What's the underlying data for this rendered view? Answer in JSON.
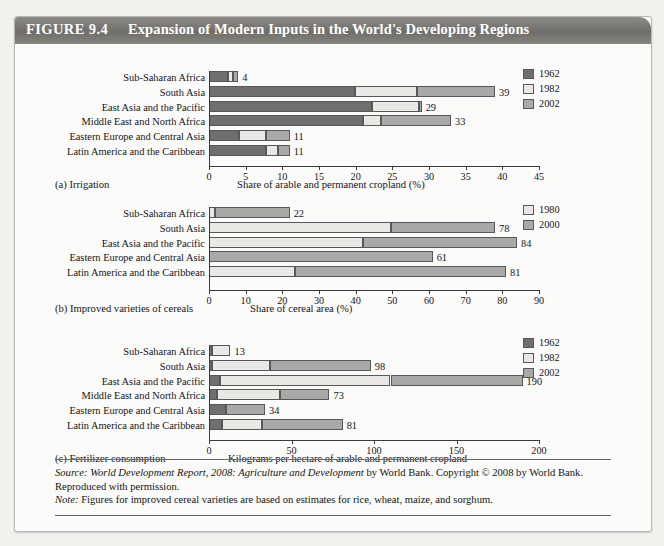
{
  "figure": {
    "tag": "FIGURE 9.4",
    "title": "Expansion of Modern Inputs in the World's Developing Regions"
  },
  "colors": {
    "series_1962": "#6f6f70",
    "series_1982": "#e9e8e4",
    "series_2002": "#a9a9a7",
    "series_1980": "#e9e8e4",
    "series_2000": "#a9a9a7",
    "titlebar": "#7a7874",
    "page_background": "#f2f1ee",
    "panel_background": "#fbfbf9"
  },
  "footer": {
    "source_label": "Source:",
    "source_italic": " World Development Report, 2008: Agriculture and Development",
    "source_rest": " by World Bank. Copyright © 2008 by World Bank. Reproduced with permission.",
    "note_label": "Note:",
    "note_text": " Figures for improved cereal varieties are based on estimates for rice, wheat, maize, and sorghum."
  },
  "panels": [
    {
      "id": "a",
      "caption": "(a) Irrigation",
      "axis_title": "Share of arable and permanent cropland (%)",
      "chart_data": {
        "type": "bar",
        "orientation": "horizontal",
        "stacked": true,
        "title": "(a) Irrigation",
        "xlabel": "Share of arable and permanent cropland (%)",
        "ylabel": "",
        "xlim": [
          0,
          45
        ],
        "ticks": [
          0,
          5,
          10,
          15,
          20,
          25,
          30,
          35,
          40,
          45
        ],
        "grid": false,
        "legend_position": "top-right",
        "legend": [
          "1962",
          "1982",
          "2002"
        ],
        "categories": [
          "Sub-Saharan Africa",
          "South Asia",
          "East Asia and the Pacific",
          "Middle East and North Africa",
          "Eastern Europe and Central Asia",
          "Latin America and the Caribbean"
        ],
        "series": [
          {
            "name": "1962",
            "values": [
              2.6,
              19.9,
              22.2,
              21.0,
              4.1,
              7.8
            ]
          },
          {
            "name": "1982",
            "values": [
              0.7,
              8.5,
              6.4,
              2.4,
              3.7,
              1.6
            ]
          },
          {
            "name": "2002",
            "values": [
              0.7,
              10.6,
              0.4,
              9.6,
              3.2,
              1.6
            ]
          }
        ],
        "totals": [
          4,
          39,
          29,
          33,
          11,
          11
        ],
        "total_labels": [
          "4",
          "39",
          "29",
          "33",
          "11",
          "11"
        ]
      }
    },
    {
      "id": "b",
      "caption": "(b) Improved varieties of cereals",
      "axis_title": "Share of cereal area (%)",
      "chart_data": {
        "type": "bar",
        "orientation": "horizontal",
        "stacked": true,
        "title": "(b) Improved varieties of cereals",
        "xlabel": "Share of cereal area (%)",
        "ylabel": "",
        "xlim": [
          0,
          90
        ],
        "ticks": [
          0,
          10,
          20,
          30,
          40,
          50,
          60,
          70,
          80,
          90
        ],
        "grid": false,
        "legend_position": "top-right",
        "legend": [
          "1980",
          "2000"
        ],
        "categories": [
          "Sub-Saharan Africa",
          "South Asia",
          "East Asia and the Pacific",
          "Eastern Europe and Central Asia",
          "Latin America and the Caribbean"
        ],
        "series": [
          {
            "name": "1980",
            "values": [
              1.5,
              49.5,
              42.0,
              0.0,
              23.5
            ]
          },
          {
            "name": "2000",
            "values": [
              20.5,
              28.5,
              42.0,
              61.0,
              57.5
            ]
          }
        ],
        "totals": [
          22,
          78,
          84,
          61,
          81
        ],
        "total_labels": [
          "22",
          "78",
          "84",
          "61",
          "81"
        ]
      }
    },
    {
      "id": "c",
      "caption": "(c) Fertilizer consumption",
      "axis_title": "Kilograms per hectare of arable and permanent cropland",
      "chart_data": {
        "type": "bar",
        "orientation": "horizontal",
        "stacked": true,
        "title": "(c) Fertilizer consumption",
        "xlabel": "Kilograms per hectare of arable and permanent cropland",
        "ylabel": "",
        "xlim": [
          0,
          200
        ],
        "ticks": [
          0,
          50,
          100,
          150,
          200
        ],
        "grid": false,
        "legend_position": "top-right",
        "legend": [
          "1962",
          "1982",
          "2002"
        ],
        "categories": [
          "Sub-Saharan Africa",
          "South Asia",
          "East Asia and the Pacific",
          "Middle East and North Africa",
          "Eastern Europe and Central Asia",
          "Latin America and the Caribbean"
        ],
        "series": [
          {
            "name": "1962",
            "values": [
              2.0,
              2.0,
              6.5,
              5.0,
              10.0,
              8.0
            ]
          },
          {
            "name": "1982",
            "values": [
              11.0,
              35.0,
              103.5,
              38.0,
              0.0,
              24.0
            ]
          },
          {
            "name": "2002",
            "values": [
              0.0,
              61.0,
              80.0,
              30.0,
              24.0,
              49.0
            ]
          }
        ],
        "segment_order": {
          "Eastern Europe and Central Asia": [
            "1962",
            "2002",
            "1982"
          ]
        },
        "totals": [
          13,
          98,
          190,
          73,
          34,
          81
        ],
        "total_labels": [
          "13",
          "98",
          "190",
          "73",
          "34",
          "81"
        ]
      }
    }
  ]
}
